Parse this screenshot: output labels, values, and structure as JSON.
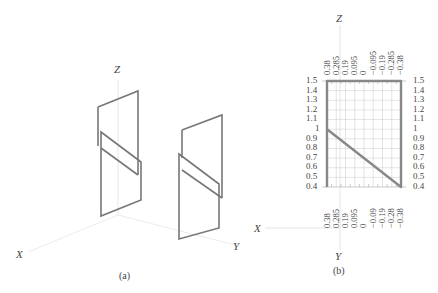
{
  "panel_a": {
    "caption": "(a)",
    "axes": {
      "x": "X",
      "y": "Y",
      "z": "Z"
    },
    "description": "Isometric view of two folded plate (parallelogram) structures along the Y axis"
  },
  "panel_b": {
    "caption": "(b)",
    "axes": {
      "x": "X",
      "y": "Y",
      "z": "Z"
    },
    "top_ticks": [
      "0.38",
      "0.285",
      "0.19",
      "0.095",
      "0",
      "−0.095",
      "−0.19",
      "−0.285",
      "−0.38"
    ],
    "bottom_ticks": [
      "0.38",
      "0.285",
      "0.19",
      "0.095",
      "0",
      "−0.09",
      "−0.19",
      "−0.28",
      "−0.38"
    ],
    "left_ticks": [
      "1.5",
      "1.4",
      "1.3",
      "1.2",
      "1.1",
      "1",
      "0.9",
      "0.8",
      "0.7",
      "0.6",
      "0.5",
      "0.4"
    ],
    "right_ticks": [
      "1.5",
      "1.4",
      "1.3",
      "1.2",
      "1.1",
      "1",
      "0.9",
      "0.8",
      "0.7",
      "0.6",
      "0.5",
      "0.4"
    ]
  },
  "colors": {
    "stroke": "#777777",
    "grid": "#cccccc",
    "axis": "#e4e4e4",
    "text": "#444444"
  }
}
